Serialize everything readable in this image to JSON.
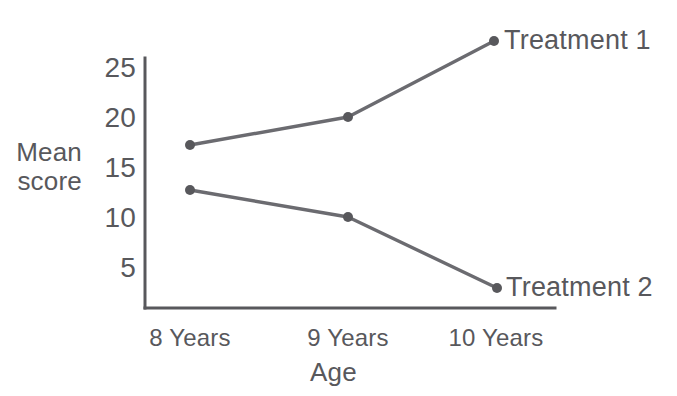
{
  "chart_data": {
    "type": "line",
    "title": "",
    "subtitle": "",
    "xlabel": "Age",
    "ylabel": "Mean score",
    "ylabel_lines": [
      "Mean",
      "score"
    ],
    "categories": [
      "8 Years",
      "9 Years",
      "10 Years"
    ],
    "xtick_labels": [
      "8 Years",
      "9 Years",
      "10 Years"
    ],
    "ytick_labels": [
      "25",
      "20",
      "15",
      "10",
      "5"
    ],
    "yticks": [
      25,
      20,
      15,
      10,
      5
    ],
    "ylim": [
      0,
      27.8
    ],
    "xlim": [
      0,
      2
    ],
    "grid": false,
    "legend_position": "right-of-endpoints",
    "series": [
      {
        "name": "Treatment 1",
        "label": "Treatment 1",
        "values": [
          17.3,
          20.0,
          27.6
        ],
        "color": "#6b6b70",
        "marker": "circle"
      },
      {
        "name": "Treatment 2",
        "label": "Treatment 2",
        "values": [
          12.3,
          10.0,
          2.5
        ],
        "color": "#6b6b70",
        "marker": "circle"
      }
    ],
    "annotations": []
  },
  "style": {
    "background": "#ffffff",
    "axis_color": "#58585c",
    "text_color": "#58585c",
    "line_color": "#6b6b70",
    "marker_color": "#58585c"
  },
  "geometry": {
    "axis_x": 145,
    "axis_top": 58,
    "axis_bottom": 308,
    "axis_right": 555,
    "category_x": [
      190,
      348,
      496
    ],
    "ytick_y": [
      68,
      118,
      168,
      218,
      268
    ],
    "series_points": [
      [
        [
          190,
          145
        ],
        [
          348,
          117
        ],
        [
          494,
          41
        ]
      ],
      [
        [
          190,
          190
        ],
        [
          348,
          217
        ],
        [
          497,
          288
        ]
      ]
    ]
  }
}
